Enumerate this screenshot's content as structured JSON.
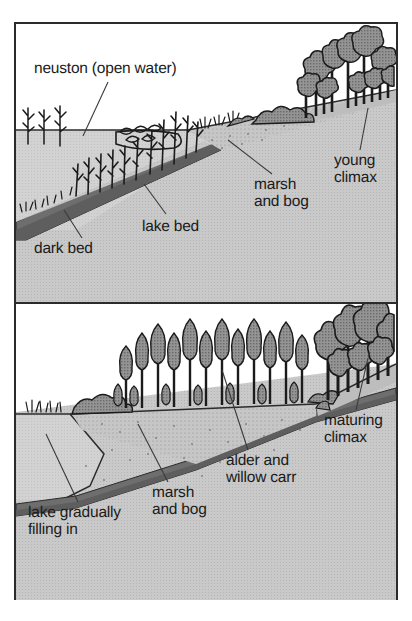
{
  "figure": {
    "panels": [
      {
        "id": "panel-top",
        "stage_name": "early hydrosere",
        "labels": [
          {
            "name": "neuston-open-water",
            "text": "neuston (open water)",
            "x": 18,
            "y": 36,
            "leader": {
              "x1": 92,
              "y1": 58,
              "x2": 67,
              "y2": 110
            }
          },
          {
            "name": "dark-bed",
            "text": "dark bed",
            "x": 18,
            "y": 218,
            "leader": {
              "x1": 66,
              "y1": 216,
              "x2": 48,
              "y2": 188
            }
          },
          {
            "name": "lake-bed",
            "text": "lake bed",
            "x": 126,
            "y": 196,
            "leader": {
              "x1": 150,
              "y1": 192,
              "x2": 128,
              "y2": 163
            }
          },
          {
            "name": "marsh-and-bog",
            "text": "marsh\nand bog",
            "x": 238,
            "y": 155,
            "leader": {
              "x1": 256,
              "y1": 152,
              "x2": 212,
              "y2": 118
            }
          },
          {
            "name": "young-climax",
            "text": "young\nclimax",
            "x": 320,
            "y": 132,
            "leader": {
              "x1": 344,
              "y1": 128,
              "x2": 350,
              "y2": 82
            }
          }
        ]
      },
      {
        "id": "panel-bottom",
        "stage_name": "later hydrosere",
        "labels": [
          {
            "name": "lake-gradually-filling-in",
            "text": "lake gradually\nfilling in",
            "x": 14,
            "y": 203,
            "leader": {
              "x1": 62,
              "y1": 200,
              "x2": 30,
              "y2": 128
            }
          },
          {
            "name": "marsh-and-bog-2",
            "text": "marsh\nand bog",
            "x": 136,
            "y": 183,
            "leader": {
              "x1": 152,
              "y1": 180,
              "x2": 122,
              "y2": 118
            }
          },
          {
            "name": "alder-and-willow-carr",
            "text": "alder and\nwillow carr",
            "x": 212,
            "y": 152,
            "leader": {
              "x1": 232,
              "y1": 148,
              "x2": 206,
              "y2": 64
            }
          },
          {
            "name": "maturing-climax",
            "text": "maturing\nclimax",
            "x": 310,
            "y": 112,
            "leader": {
              "x1": 340,
              "y1": 108,
              "x2": 350,
              "y2": 52
            }
          }
        ]
      }
    ],
    "colors": {
      "ink": "#1b1b1b",
      "frame": "#2b2b2b",
      "water": "#cfcfcf",
      "ground_light": "#c9c9c9",
      "ground_mid": "#bdbdbd",
      "marsh": "#c4c4c4",
      "dark_bed": "#6e6e6e",
      "foliage": "#8c8c8c",
      "paper": "#ffffff"
    }
  }
}
